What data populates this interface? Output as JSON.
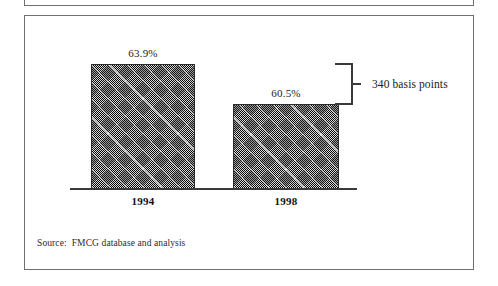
{
  "chart_data": {
    "type": "bar",
    "title": "",
    "subtitle": "",
    "xlabel": "",
    "ylabel": "",
    "categories": [
      "1994",
      "1998"
    ],
    "values": [
      63.9,
      60.5
    ],
    "value_labels": [
      "63.9%",
      "60.5%"
    ],
    "value_unit": "%",
    "series": [
      {
        "name": "",
        "values": [
          63.9,
          60.5
        ],
        "labels": [
          "63.9%",
          "60.5%"
        ]
      }
    ],
    "grid": false,
    "legend": false,
    "axis_visible": {
      "x": true,
      "y": false
    },
    "bar_fill": "crosshatch-dither-gray",
    "bar_fill_color": "#6a6a6a",
    "annotations": [
      {
        "kind": "bracket",
        "text": "340 basis points",
        "from_category": "1994",
        "to_category": "1998",
        "value_delta": 3.4,
        "value_delta_unit": "basis points",
        "value_delta_display": "340"
      }
    ]
  },
  "exhibit": {
    "values": {
      "bar_1": "63.9%",
      "bar_2": "60.5%"
    },
    "categories": {
      "cat_1": "1994",
      "cat_2": "1998"
    },
    "bracket_label": "340 basis points",
    "source": {
      "label": "Source:",
      "text": "FMCG database and analysis"
    }
  },
  "colors": {
    "frame": "#6f6f6f",
    "axis": "#3a3a3a",
    "bar": "#6a6a6a",
    "bar_border": "#2b2b2b",
    "text": "#1a1a1a",
    "background": "#ffffff"
  }
}
